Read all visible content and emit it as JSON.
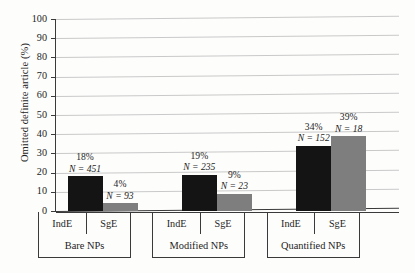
{
  "figure": {
    "y_axis_title": "Omitted definite article (%)"
  },
  "chart_data": {
    "type": "bar",
    "title": "",
    "xlabel": "",
    "ylabel": "Omitted definite article (%)",
    "ylim": [
      0,
      100
    ],
    "yticks": [
      0,
      10,
      20,
      30,
      40,
      50,
      60,
      70,
      80,
      90,
      100
    ],
    "ytick_labels": [
      "0",
      "10",
      "20",
      "30",
      "40",
      "50",
      "60",
      "70",
      "80",
      "90",
      "100"
    ],
    "grid": true,
    "legend": false,
    "categories": [
      "Bare NPs",
      "Modified NPs",
      "Quantified NPs"
    ],
    "subcategories": [
      "IndE",
      "SgE"
    ],
    "colors": {
      "IndE": "#141414",
      "SgE": "#7e7e7e",
      "gridline": "#c9c9c9",
      "axis": "#3a3a3a"
    },
    "series": [
      {
        "name": "IndE",
        "values": [
          18,
          19,
          34
        ]
      },
      {
        "name": "SgE",
        "values": [
          4,
          9,
          39
        ]
      }
    ],
    "bars": [
      {
        "group": "Bare NPs",
        "sub": "IndE",
        "percent": 18,
        "pct_label": "18%",
        "n": 451,
        "n_label": "N = 451"
      },
      {
        "group": "Bare NPs",
        "sub": "SgE",
        "percent": 4,
        "pct_label": "4%",
        "n": 93,
        "n_label": "N = 93"
      },
      {
        "group": "Modified NPs",
        "sub": "IndE",
        "percent": 19,
        "pct_label": "19%",
        "n": 235,
        "n_label": "N = 235"
      },
      {
        "group": "Modified NPs",
        "sub": "SgE",
        "percent": 9,
        "pct_label": "9%",
        "n": 23,
        "n_label": "N = 23"
      },
      {
        "group": "Quantified NPs",
        "sub": "IndE",
        "percent": 34,
        "pct_label": "34%",
        "n": 152,
        "n_label": "N = 152"
      },
      {
        "group": "Quantified NPs",
        "sub": "SgE",
        "percent": 39,
        "pct_label": "39%",
        "n": 18,
        "n_label": "N = 18"
      }
    ]
  },
  "axis": {
    "ticks": [
      {
        "label": "100"
      },
      {
        "label": "90"
      },
      {
        "label": "80"
      },
      {
        "label": "70"
      },
      {
        "label": "60"
      },
      {
        "label": "50"
      },
      {
        "label": "40"
      },
      {
        "label": "30"
      },
      {
        "label": "20"
      },
      {
        "label": "10"
      },
      {
        "label": "0"
      }
    ]
  },
  "groups": [
    {
      "label": "Bare NPs",
      "sub": [
        {
          "label": "IndE"
        },
        {
          "label": "SgE"
        }
      ]
    },
    {
      "label": "Modified NPs",
      "sub": [
        {
          "label": "IndE"
        },
        {
          "label": "SgE"
        }
      ]
    },
    {
      "label": "Quantified NPs",
      "sub": [
        {
          "label": "IndE"
        },
        {
          "label": "SgE"
        }
      ]
    }
  ]
}
